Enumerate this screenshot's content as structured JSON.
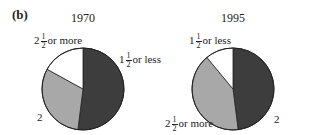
{
  "panel_label": "(b)",
  "chart_data": [
    {
      "type": "pie",
      "title": "1970",
      "slices": [
        {
          "label": "1 1/2 or less",
          "value": 52,
          "color": "#3d3d3d"
        },
        {
          "label": "2",
          "value": 31,
          "color": "#a8a8a8"
        },
        {
          "label": "2 1/2 or more",
          "value": 17,
          "color": "#ffffff"
        }
      ],
      "start_angle_deg": 0,
      "direction": "clockwise"
    },
    {
      "type": "pie",
      "title": "1995",
      "slices": [
        {
          "label": "2",
          "value": 48,
          "color": "#3d3d3d"
        },
        {
          "label": "2 1/2 or more",
          "value": 41,
          "color": "#a8a8a8"
        },
        {
          "label": "1 1/2 or less",
          "value": 11,
          "color": "#ffffff"
        }
      ],
      "start_angle_deg": 0,
      "direction": "clockwise"
    }
  ],
  "labels": {
    "p1": {
      "s1_whole": "1",
      "s1_num": "1",
      "s1_den": "2",
      "s1_rest": "or less",
      "s2": "2",
      "s3_whole": "2",
      "s3_num": "1",
      "s3_den": "2",
      "s3_rest": "or more"
    },
    "p2": {
      "s1": "2",
      "s2_whole": "2",
      "s2_num": "1",
      "s2_den": "2",
      "s2_rest": "or more",
      "s3_whole": "1",
      "s3_num": "1",
      "s3_den": "2",
      "s3_rest": "or less"
    }
  }
}
